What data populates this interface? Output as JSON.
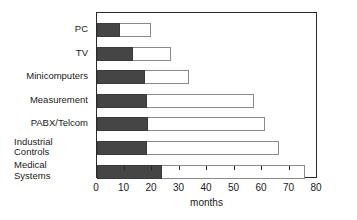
{
  "chart_data": {
    "type": "bar",
    "orientation": "horizontal",
    "stacked": true,
    "title": "",
    "xlabel": "months",
    "ylabel": "",
    "xlim": [
      0,
      80
    ],
    "xticks": [
      0,
      10,
      20,
      30,
      40,
      50,
      60,
      70,
      80
    ],
    "xtick_labels": [
      "0",
      "10",
      "20",
      "30",
      "40",
      "50",
      "60",
      "70",
      "80"
    ],
    "grid": false,
    "legend": null,
    "categories": [
      "PC",
      "TV",
      "Minicomputers",
      "Measurement",
      "PABX/Telcom",
      "Industrial\nControls",
      "Medical\nSystems"
    ],
    "series": [
      {
        "name": "dark-segment",
        "color": "#454545",
        "values": [
          8.5,
          13,
          17.5,
          18,
          18.5,
          18,
          23.5
        ]
      },
      {
        "name": "light-segment",
        "color": "#ffffff",
        "values": [
          11,
          14,
          16,
          39,
          42.5,
          48,
          52
        ]
      }
    ],
    "totals": [
      19.5,
      27,
      33.5,
      57,
      61,
      66,
      75.5
    ]
  },
  "style": {
    "frame_color": "#2b2b2b",
    "dark_fill": "#454545",
    "light_fill": "#ffffff",
    "light_outline": "#8a8a8a",
    "text_color": "#1a1a1a"
  }
}
